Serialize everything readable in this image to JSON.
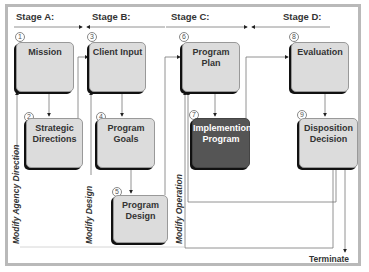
{
  "stages": [
    {
      "label": "Stage A:"
    },
    {
      "label": "Stage B:"
    },
    {
      "label": "Stage C:"
    },
    {
      "label": "Stage D:"
    }
  ],
  "boxes": [
    {
      "num": "1",
      "label": "Mission"
    },
    {
      "num": "2",
      "label": "Strategic\nDirections"
    },
    {
      "num": "3",
      "label": "Client Input"
    },
    {
      "num": "4",
      "label": "Program\nGoals"
    },
    {
      "num": "5",
      "label": "Program\nDesign"
    },
    {
      "num": "6",
      "label": "Program\nPlan"
    },
    {
      "num": "7",
      "label": "Implemention\nProgram"
    },
    {
      "num": "8",
      "label": "Evaluation"
    },
    {
      "num": "9",
      "label": "Disposition\nDecision"
    }
  ],
  "feedback_labels": {
    "agency": "Modify Agency Direction",
    "design": "Modify Design",
    "operation": "Modify Operation"
  },
  "terminate_label": "Terminate",
  "colors": {
    "box_fill": "#dcdcdc",
    "highlight_box_fill": "#555555",
    "frame": "#b9b9b9"
  }
}
